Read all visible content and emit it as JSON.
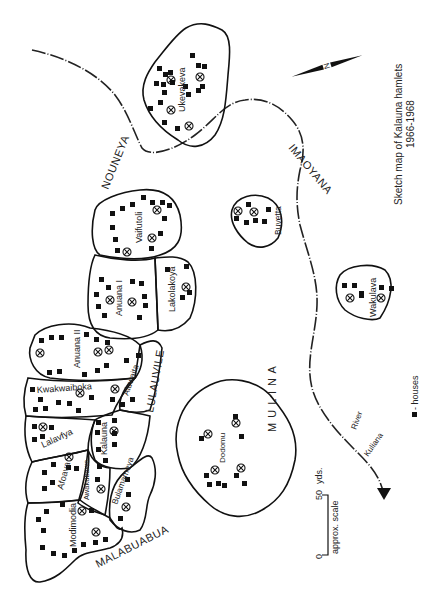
{
  "title": {
    "line1": "Sketch map of Kalauna hamlets",
    "line2": "1966-1968"
  },
  "compass": {
    "label": "N"
  },
  "legend": {
    "symbol": "houses-icon",
    "label": "- houses"
  },
  "scale": {
    "start": "0",
    "end": "50",
    "unit": "yds.",
    "caption": "approx. scale"
  },
  "river": {
    "name_part1": "River",
    "name_part2": "Kuliana"
  },
  "areas": {
    "nouneya": "NOUNEYA",
    "imaoyana": "IMAOYANA",
    "lulauvile": "LULAUVILE",
    "mulina": "M U L I N A",
    "malabuabua": "MALABUABUA"
  },
  "hamlets": {
    "ukevakeva": "Ukevakeva",
    "vaifutoli": "Vaifutoli",
    "buvetta": "Buvetta",
    "anuana_i": "Anuana I",
    "lakolakoya": "Lakolakoya",
    "wakulava": "Wakulava",
    "anuana_ii": "Anuana II",
    "aluwaita": "Aluwaita",
    "kwakwaiboka": "Kwakwaiboka",
    "lalavfya": "Lalavfya",
    "kalauna": "Kalauna",
    "afoava": "Afoava",
    "awakubawe": "Awakubawe",
    "bulamameya": "Bulamameya",
    "dodomu": "Dodomu",
    "modimodia": "Modimodia"
  }
}
